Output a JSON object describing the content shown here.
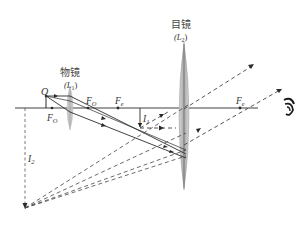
{
  "diagram": {
    "colors": {
      "ink": "#2a2a2a",
      "lens_fill": "#b8b8b8",
      "lens_edge": "#8a8a8a",
      "background": "#ffffff"
    },
    "objective": {
      "name_cn": "物镜",
      "symbol": "(L",
      "sub": "1",
      "close": ")"
    },
    "eyepiece": {
      "name_cn": "目镜",
      "symbol": "(L",
      "sub": "2",
      "close": ")"
    },
    "labels": {
      "object": "O",
      "focal_objective_left": {
        "main": "F",
        "sub": "O"
      },
      "focal_objective_right": {
        "main": "F",
        "sub": "O"
      },
      "focal_eyepiece_left": {
        "main": "F",
        "sub": "e"
      },
      "focal_eyepiece_right": {
        "main": "F",
        "sub": "e"
      },
      "image_intermediate": {
        "main": "I",
        "sub": "1"
      },
      "image_final": {
        "main": "I",
        "sub": "2"
      }
    },
    "eye_icon": "eye-icon"
  }
}
